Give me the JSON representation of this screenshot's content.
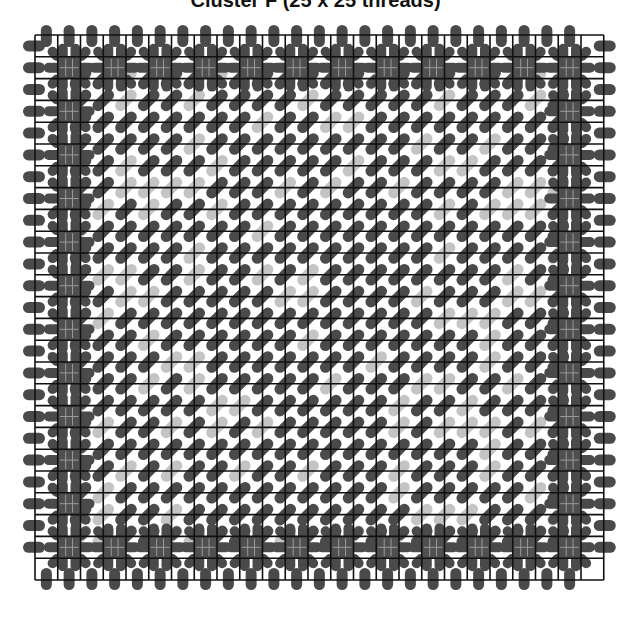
{
  "title": "Cluster F (25 x 25 threads)",
  "diagram": {
    "grid": {
      "cols": 25,
      "rows": 25,
      "origin_x": 35,
      "origin_y": 35,
      "cell_w": 22.75,
      "cell_h": 21.8,
      "line_color": "#111111",
      "line_width": 1.6
    },
    "colors": {
      "dark_pill": "#4a4a4a",
      "light_pill": "#c4c4c4",
      "block_fill": "#4f4f4f",
      "block_inner_line": "#9a9a9a"
    },
    "edge_pills": {
      "top": "vertical pills centered on each column midpoint, straddling top edge",
      "bottom": "vertical pills centered on each column midpoint, straddling bottom edge",
      "left": "horizontal pills centered on each row midpoint, straddling left edge",
      "right": "horizontal pills centered on each row midpoint, straddling right edge"
    },
    "border_blocks": {
      "description": "dark filled cells with radiating pills on the inner border ring",
      "ring_index": [
        1,
        23
      ],
      "positions": "odd indices 1..23 along row 1, row 23, col 1, col 23"
    },
    "interior_pills": {
      "orientation": "diagonal lower-left to upper-right, centered at grid intersections",
      "light_ratio": 0.22
    }
  }
}
